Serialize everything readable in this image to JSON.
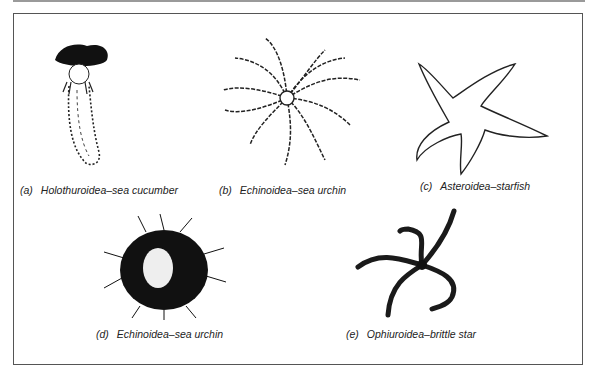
{
  "figure": {
    "panels": [
      {
        "id": "a",
        "label": "(a)",
        "caption": "Holothuroidea–sea cucumber",
        "icon": "sea-cucumber-icon"
      },
      {
        "id": "b",
        "label": "(b)",
        "caption": "Echinoidea–sea urchin",
        "icon": "feathery-urchin-icon"
      },
      {
        "id": "c",
        "label": "(c)",
        "caption": "Asteroidea–starfish",
        "icon": "starfish-icon"
      },
      {
        "id": "d",
        "label": "(d)",
        "caption": "Echinoidea–sea urchin",
        "icon": "spiny-urchin-icon"
      },
      {
        "id": "e",
        "label": "(e)",
        "caption": "Ophiuroidea–brittle star",
        "icon": "brittle-star-icon"
      }
    ]
  }
}
